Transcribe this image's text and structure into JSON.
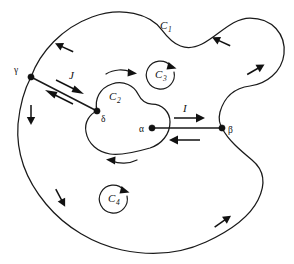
{
  "figure": {
    "background_color": "#ffffff",
    "stroke_color": "#1a1a1a",
    "width": 294,
    "height": 264
  },
  "contours": [
    {
      "id": "C1",
      "label": "C",
      "subscript": "1",
      "role": "outer-boundary",
      "orientation": "counterclockwise",
      "label_x": 165,
      "label_y": 25
    },
    {
      "id": "C2",
      "label": "C",
      "subscript": "2",
      "role": "inner-hole-boundary",
      "orientation": "clockwise",
      "label_x": 114,
      "label_y": 98
    },
    {
      "id": "C3",
      "label": "C",
      "subscript": "3",
      "role": "circulation-indicator",
      "orientation": "counterclockwise",
      "label_x": 160,
      "label_y": 74
    },
    {
      "id": "C4",
      "label": "C",
      "subscript": "4",
      "role": "circulation-indicator",
      "orientation": "counterclockwise",
      "label_x": 113,
      "label_y": 198
    }
  ],
  "nodes": [
    {
      "id": "gamma",
      "label": "γ",
      "x": 31,
      "y": 77,
      "label_x": 18,
      "label_y": 70
    },
    {
      "id": "delta",
      "label": "δ",
      "x": 97,
      "y": 111,
      "label_x": 104,
      "label_y": 120
    },
    {
      "id": "alpha",
      "label": "α",
      "x": 152,
      "y": 128,
      "label_x": 143,
      "label_y": 131
    },
    {
      "id": "beta",
      "label": "β",
      "x": 222,
      "y": 128,
      "label_x": 230,
      "label_y": 132
    }
  ],
  "cuts": [
    {
      "id": "cut-I",
      "label": "I",
      "from": "alpha",
      "to": "beta",
      "label_x": 185,
      "label_y": 110,
      "forward_arrow_dir": "right",
      "return_arrow_dir": "left"
    },
    {
      "id": "cut-J",
      "label": "J",
      "from": "gamma",
      "to": "delta",
      "label_x": 72,
      "label_y": 76,
      "forward_arrow_dir": "down-right",
      "return_arrow_dir": "up-left"
    }
  ],
  "direction_arrows": [
    {
      "id": "outer-top-left",
      "on": "C1",
      "x": 65,
      "y": 48,
      "angle": 205
    },
    {
      "id": "outer-top-right",
      "on": "C1",
      "x": 222,
      "y": 42,
      "angle": 205
    },
    {
      "id": "outer-right-upper",
      "on": "C1",
      "x": 255,
      "y": 70,
      "angle": 330
    },
    {
      "id": "outer-left",
      "on": "C1",
      "x": 31,
      "y": 114,
      "angle": 90
    },
    {
      "id": "outer-bottom-left",
      "on": "C1",
      "x": 60,
      "y": 197,
      "angle": 62
    },
    {
      "id": "outer-bottom-right",
      "on": "C1",
      "x": 222,
      "y": 222,
      "angle": 325
    }
  ],
  "inner_arrows": [
    {
      "id": "c2-top-arrow",
      "on": "C2",
      "direction": "right"
    },
    {
      "id": "c2-bottom-arrow",
      "on": "C2",
      "direction": "left"
    }
  ]
}
